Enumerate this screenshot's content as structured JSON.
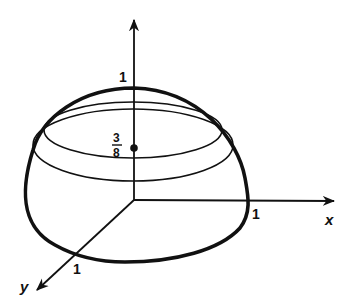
{
  "figure": {
    "axes": {
      "z_tick_label": "1",
      "x_tick_label": "1",
      "x_axis_label": "x",
      "y_tick_label": "1",
      "y_axis_label": "y"
    },
    "centroid": {
      "numerator": "3",
      "denominator": "8"
    },
    "colors": {
      "stroke": "#111111",
      "background": "#ffffff"
    }
  }
}
